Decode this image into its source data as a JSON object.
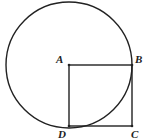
{
  "diagram": {
    "type": "geometry",
    "shapes": [
      "circle centered at A passing through B and D",
      "square ABCD"
    ],
    "labels": {
      "A": "A",
      "B": "B",
      "C": "C",
      "D": "D"
    },
    "stroke_color": "#222222"
  }
}
